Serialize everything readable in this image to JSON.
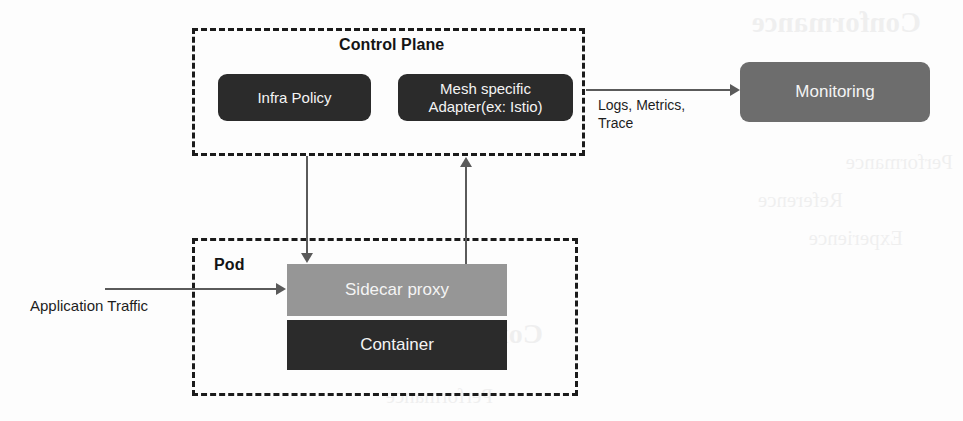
{
  "diagram": {
    "background_color": "#fdfdfd",
    "colors": {
      "node_dark": "#2b2b2b",
      "node_mid_gray": "#6d6d6d",
      "node_light_gray": "#969696",
      "group_border": "#1b1b1b",
      "connector": "#5a5a5a",
      "node_text": "#f4f4f4",
      "label_text": "#1d1d1d"
    },
    "groups": [
      {
        "id": "control-plane",
        "label": "Control Plane",
        "border_style": "dashed"
      },
      {
        "id": "pod",
        "label": "Pod",
        "border_style": "dashed"
      }
    ],
    "nodes": [
      {
        "id": "infra-policy",
        "label": "Infra Policy",
        "fill": "#2b2b2b",
        "shape": "rounded-rect",
        "group": "control-plane"
      },
      {
        "id": "mesh-adapter",
        "label": "Mesh specific\nAdapter(ex: Istio)",
        "fill": "#2b2b2b",
        "shape": "rounded-rect",
        "group": "control-plane"
      },
      {
        "id": "monitoring",
        "label": "Monitoring",
        "fill": "#6d6d6d",
        "shape": "rounded-rect",
        "group": null
      },
      {
        "id": "sidecar-proxy",
        "label": "Sidecar proxy",
        "fill": "#969696",
        "shape": "rect",
        "group": "pod"
      },
      {
        "id": "container",
        "label": "Container",
        "fill": "#2b2b2b",
        "shape": "rect",
        "group": "pod"
      }
    ],
    "edges": [
      {
        "id": "control-plane-to-monitoring",
        "from": "control-plane",
        "to": "monitoring",
        "label": "Logs, Metrics,\nTrace",
        "direction": "right"
      },
      {
        "id": "infra-policy-to-sidecar",
        "from": "infra-policy",
        "to": "sidecar-proxy",
        "label": "",
        "direction": "down"
      },
      {
        "id": "sidecar-to-mesh-adapter",
        "from": "sidecar-proxy",
        "to": "mesh-adapter",
        "label": "",
        "direction": "up"
      },
      {
        "id": "application-traffic-to-sidecar",
        "from": "external",
        "to": "sidecar-proxy",
        "label": "Application Traffic",
        "direction": "right"
      }
    ],
    "bleed_through_text": [
      "Conformance",
      "Performance",
      "Reference",
      "Experience"
    ]
  }
}
